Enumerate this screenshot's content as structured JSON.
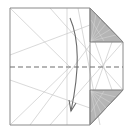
{
  "diagram": {
    "colors": {
      "paper": "#ffffff",
      "outline": "#8a8a8a",
      "crease": "#c8c8c8",
      "flap_fill": "#b4b4b4",
      "flap_lines": "#d6d6d6",
      "fold_line": "#6e6e6e",
      "arrow": "#6a6a6a"
    },
    "elements": {
      "paper": "paper-outline",
      "top_flap": "folded-corner-top",
      "bottom_flap": "folded-corner-bottom",
      "valley_fold": "dashed-valley-fold-line",
      "arrow": "fold-down-arrow"
    }
  }
}
